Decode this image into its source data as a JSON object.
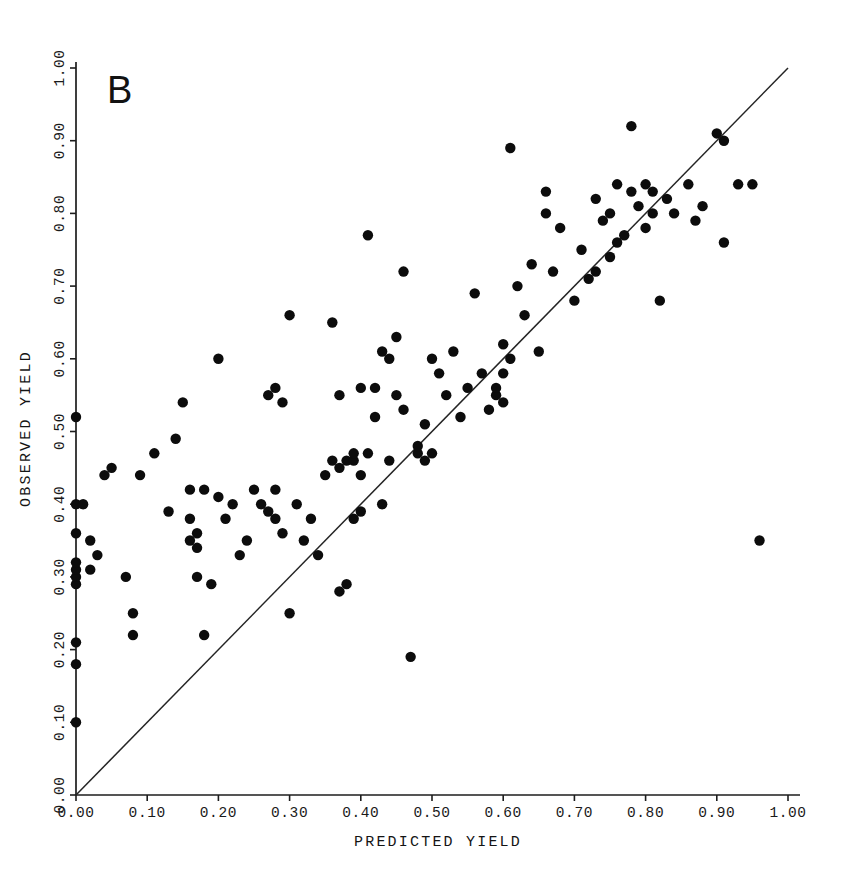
{
  "figure": {
    "panel_label": "B",
    "background_color": "#ffffff",
    "ink_color": "#111111"
  },
  "chart_data": {
    "type": "scatter",
    "title": "",
    "subtitle": "",
    "panel_label": "B",
    "xlabel": "PREDICTED YIELD",
    "ylabel": "OBSERVED YIELD",
    "xlim": [
      0.0,
      1.0
    ],
    "ylim": [
      0.0,
      1.0
    ],
    "grid": false,
    "legend": null,
    "xticks": [
      0.0,
      0.1,
      0.2,
      0.3,
      0.4,
      0.5,
      0.6,
      0.7,
      0.8,
      0.9,
      1.0
    ],
    "yticks": [
      0.0,
      0.1,
      0.2,
      0.3,
      0.4,
      0.5,
      0.6,
      0.7,
      0.8,
      0.9,
      1.0
    ],
    "xticklabels": [
      "0.00",
      "0.10",
      "0.20",
      "0.30",
      "0.40",
      "0.50",
      "0.60",
      "0.70",
      "0.80",
      "0.90",
      "1.00"
    ],
    "yticklabels": [
      "0.00",
      "0.10",
      "0.20",
      "0.30",
      "0.40",
      "0.50",
      "0.60",
      "0.70",
      "0.80",
      "0.90",
      "1.00"
    ],
    "marker": "filled-circle",
    "marker_color": "#0c0c0c",
    "marker_size": 5.2,
    "reference_line": {
      "name": "one-to-one line",
      "type": "identity",
      "slope": 1.0,
      "intercept": 0.0,
      "x_start": 0.0,
      "x_end": 1.0,
      "color": "#242424",
      "style": "solid"
    },
    "n_points": 133,
    "x": [
      0.0,
      0.0,
      0.0,
      0.0,
      0.0,
      0.0,
      0.0,
      0.0,
      0.0,
      0.0,
      0.01,
      0.02,
      0.02,
      0.03,
      0.04,
      0.05,
      0.07,
      0.08,
      0.08,
      0.09,
      0.11,
      0.13,
      0.14,
      0.15,
      0.16,
      0.16,
      0.16,
      0.17,
      0.17,
      0.17,
      0.18,
      0.18,
      0.19,
      0.2,
      0.2,
      0.21,
      0.22,
      0.23,
      0.24,
      0.25,
      0.26,
      0.27,
      0.27,
      0.28,
      0.28,
      0.28,
      0.29,
      0.29,
      0.3,
      0.3,
      0.31,
      0.32,
      0.33,
      0.34,
      0.35,
      0.36,
      0.36,
      0.37,
      0.37,
      0.37,
      0.38,
      0.38,
      0.39,
      0.39,
      0.39,
      0.4,
      0.4,
      0.4,
      0.41,
      0.41,
      0.42,
      0.42,
      0.43,
      0.43,
      0.44,
      0.44,
      0.45,
      0.45,
      0.46,
      0.46,
      0.47,
      0.48,
      0.48,
      0.49,
      0.49,
      0.5,
      0.5,
      0.51,
      0.52,
      0.53,
      0.54,
      0.55,
      0.56,
      0.57,
      0.58,
      0.59,
      0.59,
      0.6,
      0.6,
      0.6,
      0.61,
      0.61,
      0.62,
      0.63,
      0.64,
      0.65,
      0.66,
      0.66,
      0.67,
      0.68,
      0.7,
      0.71,
      0.72,
      0.73,
      0.73,
      0.74,
      0.75,
      0.75,
      0.76,
      0.76,
      0.77,
      0.78,
      0.78,
      0.79,
      0.8,
      0.8,
      0.81,
      0.81,
      0.82,
      0.83,
      0.84,
      0.86,
      0.87,
      0.88,
      0.9,
      0.91,
      0.91,
      0.93,
      0.95,
      0.96
    ],
    "y": [
      0.1,
      0.18,
      0.21,
      0.29,
      0.3,
      0.31,
      0.32,
      0.36,
      0.4,
      0.52,
      0.4,
      0.31,
      0.35,
      0.33,
      0.44,
      0.45,
      0.3,
      0.22,
      0.25,
      0.44,
      0.47,
      0.39,
      0.49,
      0.54,
      0.35,
      0.38,
      0.42,
      0.3,
      0.34,
      0.36,
      0.22,
      0.42,
      0.29,
      0.41,
      0.6,
      0.38,
      0.4,
      0.33,
      0.35,
      0.42,
      0.4,
      0.39,
      0.55,
      0.38,
      0.42,
      0.56,
      0.36,
      0.54,
      0.25,
      0.66,
      0.4,
      0.35,
      0.38,
      0.33,
      0.44,
      0.46,
      0.65,
      0.28,
      0.45,
      0.55,
      0.29,
      0.46,
      0.38,
      0.46,
      0.47,
      0.39,
      0.44,
      0.56,
      0.47,
      0.77,
      0.52,
      0.56,
      0.4,
      0.61,
      0.46,
      0.6,
      0.55,
      0.63,
      0.53,
      0.72,
      0.19,
      0.47,
      0.48,
      0.46,
      0.51,
      0.47,
      0.6,
      0.58,
      0.55,
      0.61,
      0.52,
      0.56,
      0.69,
      0.58,
      0.53,
      0.55,
      0.56,
      0.54,
      0.58,
      0.62,
      0.6,
      0.89,
      0.7,
      0.66,
      0.73,
      0.61,
      0.8,
      0.83,
      0.72,
      0.78,
      0.68,
      0.75,
      0.71,
      0.72,
      0.82,
      0.79,
      0.74,
      0.8,
      0.76,
      0.84,
      0.77,
      0.83,
      0.92,
      0.81,
      0.78,
      0.84,
      0.8,
      0.83,
      0.68,
      0.82,
      0.8,
      0.84,
      0.79,
      0.81,
      0.91,
      0.9,
      0.76,
      0.84,
      0.84,
      0.35
    ]
  },
  "geometry": {
    "origin_x_px": 76,
    "origin_y_px": 795,
    "x_px_per_unit": 712,
    "y_px_per_unit": 727,
    "axis_x_end_px": 800,
    "axis_y_end_px": 62
  }
}
